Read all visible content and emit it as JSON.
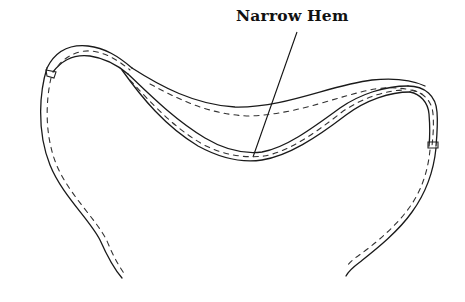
{
  "diagram": {
    "title": "Narrow Hem",
    "callouts": [
      {
        "label": "Narrow Hem",
        "target": "hemmed neckline edge"
      }
    ],
    "colors": {
      "ink": "#1a1a1a",
      "background": "#ffffff"
    }
  }
}
